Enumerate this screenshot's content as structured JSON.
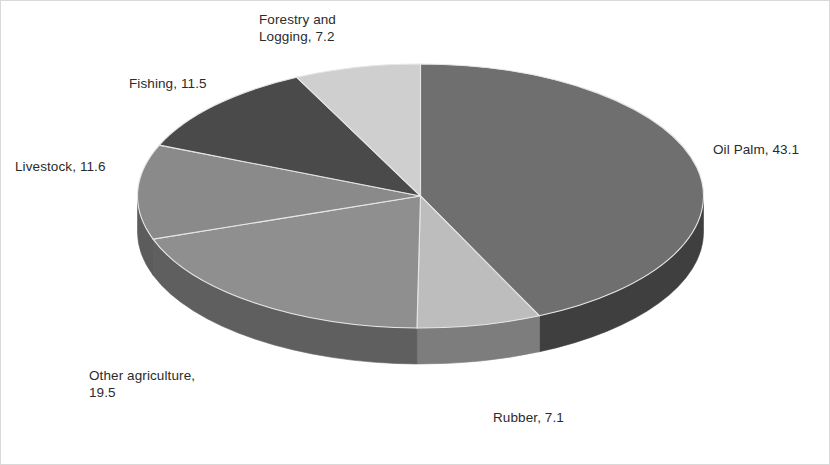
{
  "chart_data": {
    "type": "pie",
    "title": "",
    "subtitle": "",
    "xlabel": "",
    "ylabel": "",
    "legend_position": "none",
    "grid": false,
    "style": "3d-pie",
    "start_angle_deg": 0,
    "direction": "clockwise",
    "total": 100.0,
    "categories": [
      "Oil Palm",
      "Rubber",
      "Other agriculture",
      "Livestock",
      "Fishing",
      "Forestry and Logging"
    ],
    "values": [
      43.1,
      7.1,
      19.5,
      11.6,
      11.5,
      7.2
    ],
    "colors": [
      "#6f6f6f",
      "#bdbdbd",
      "#8f8f8f",
      "#8a8a8a",
      "#4a4a4a",
      "#cfcfcf"
    ],
    "side_colors": [
      "#3f3f3f",
      "#7d7d7d",
      "#5f5f5f",
      "#5c5c5c",
      "#2e2e2e",
      "#8d8d8d"
    ],
    "data_labels": [
      {
        "key": "oil_palm",
        "text": "Oil Palm, 43.1",
        "value": 43.1
      },
      {
        "key": "rubber",
        "text": "Rubber, 7.1",
        "value": 7.1
      },
      {
        "key": "other_ag",
        "text": "Other agriculture,\n19.5",
        "value": 19.5
      },
      {
        "key": "livestock",
        "text": "Livestock, 11.6",
        "value": 11.6
      },
      {
        "key": "fishing",
        "text": "Fishing, 11.5",
        "value": 11.5
      },
      {
        "key": "forestry",
        "text": "Forestry and\nLogging, 7.2",
        "value": 7.2
      }
    ]
  },
  "labels": {
    "oil_palm": "Oil Palm, 43.1",
    "rubber": "Rubber, 7.1",
    "other_agriculture": "Other agriculture,\n19.5",
    "livestock": "Livestock, 11.6",
    "fishing": "Fishing, 11.5",
    "forestry_and_logging": "Forestry and\nLogging, 7.2"
  }
}
